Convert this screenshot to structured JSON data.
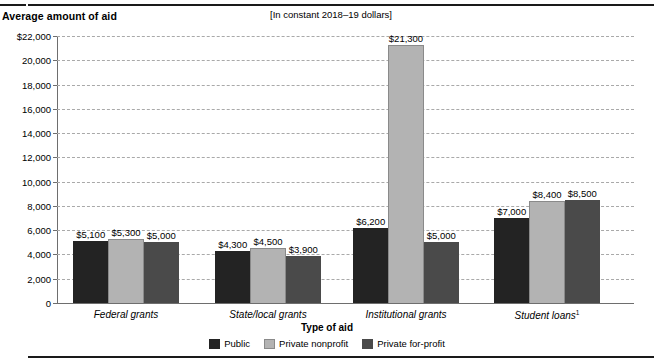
{
  "header": {
    "y_axis_title": "Average amount of aid",
    "units_note": "[In constant 2018–19 dollars]"
  },
  "legend": {
    "title": "Type of aid",
    "items": [
      {
        "label": "Public",
        "key": "public",
        "color": "#232323"
      },
      {
        "label": "Private nonprofit",
        "key": "nonprofit",
        "color": "#b3b3b3"
      },
      {
        "label": "Private for-profit",
        "key": "forprofit",
        "color": "#4a4a4a"
      }
    ]
  },
  "axis": {
    "x_title": "Type of aid",
    "y_ticks": [
      "$22,000",
      "20,000",
      "18,000",
      "16,000",
      "14,000",
      "12,000",
      "10,000",
      "8,000",
      "6,000",
      "4,000",
      "2,000",
      "0"
    ],
    "y_tick_values": [
      22000,
      20000,
      18000,
      16000,
      14000,
      12000,
      10000,
      8000,
      6000,
      4000,
      2000,
      0
    ]
  },
  "chart_data": {
    "type": "bar",
    "title": "Average amount of aid",
    "subtitle": "[In constant 2018–19 dollars]",
    "xlabel": "Type of aid",
    "ylabel": "Average amount of aid",
    "ylim": [
      0,
      22000
    ],
    "ytick_step": 2000,
    "grid": true,
    "legend_position": "bottom",
    "categories": [
      "Federal grants",
      "State/local grants",
      "Institutional grants",
      "Student loans¹"
    ],
    "category_labels": [
      {
        "text": "Federal grants",
        "footnote": ""
      },
      {
        "text": "State/local grants",
        "footnote": ""
      },
      {
        "text": "Institutional grants",
        "footnote": ""
      },
      {
        "text": "Student loans",
        "footnote": "1"
      }
    ],
    "series": [
      {
        "name": "Public",
        "color": "#232323",
        "values": [
          5100,
          4300,
          6200,
          7000
        ],
        "labels": [
          "$5,100",
          "$4,300",
          "$6,200",
          "$7,000"
        ]
      },
      {
        "name": "Private nonprofit",
        "color": "#b3b3b3",
        "values": [
          5300,
          4500,
          21300,
          8400
        ],
        "labels": [
          "$5,300",
          "$4,500",
          "$21,300",
          "$8,400"
        ]
      },
      {
        "name": "Private for-profit",
        "color": "#4a4a4a",
        "values": [
          5000,
          3900,
          5000,
          8500
        ],
        "labels": [
          "$5,000",
          "$3,900",
          "$5,000",
          "$8,500"
        ]
      }
    ]
  }
}
